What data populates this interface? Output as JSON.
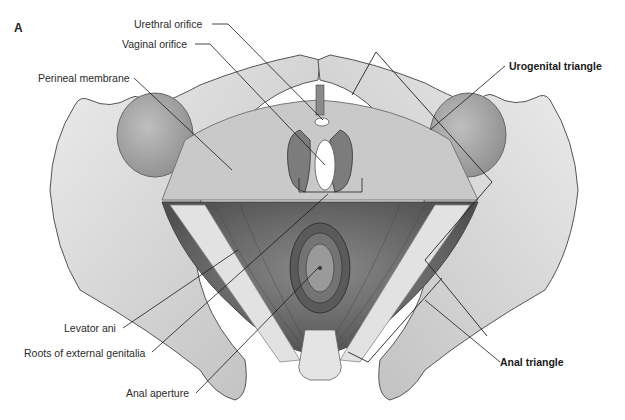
{
  "figure": {
    "panel_letter": "A",
    "colors": {
      "background": "#ffffff",
      "bone": "#d9d9d9",
      "bone_shadow": "#a8a8a8",
      "membrane": "#c8c8c8",
      "muscle": "#6e6e6e",
      "orifice": "#ffffff",
      "leader_line": "#1a1a1a"
    },
    "labels": {
      "urethral_orifice": "Urethral orifice",
      "vaginal_orifice": "Vaginal orifice",
      "perineal_membrane": "Perineal membrane",
      "urogenital_triangle": "Urogenital triangle",
      "levator_ani": "Levator ani",
      "roots_external_genitalia": "Roots of external genitalia",
      "anal_aperture": "Anal aperture",
      "anal_triangle": "Anal triangle"
    }
  }
}
